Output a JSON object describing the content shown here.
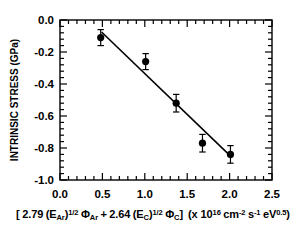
{
  "chart_data": {
    "type": "scatter",
    "title": "",
    "xlabel": "[2.79 (E_Ar)^1/2 Φ_Ar + 2.64 (E_C)^1/2 Φ_C] (x 10^16 cm^-2 s^-1 eV^0.5)",
    "ylabel": "INTRINSIC STRESS (GPa)",
    "xlim": [
      0.0,
      2.5
    ],
    "ylim": [
      -1.0,
      0.0
    ],
    "grid": false,
    "legend": "none",
    "xticks": [
      "0.0",
      "0.5",
      "1.0",
      "1.5",
      "2.0",
      "2.5"
    ],
    "xtick_values": [
      0.0,
      0.5,
      1.0,
      1.5,
      2.0,
      2.5
    ],
    "yticks": [
      "0.0",
      "-0.2",
      "-0.4",
      "-0.6",
      "-0.8",
      "-1.0"
    ],
    "ytick_values": [
      0.0,
      -0.2,
      -0.4,
      -0.6,
      -0.8,
      -1.0
    ],
    "minor_ticks_per_interval": 5,
    "marker": "filled-circle",
    "marker_color": "#000000",
    "x": [
      0.48,
      1.01,
      1.37,
      1.68,
      2.01
    ],
    "y": [
      -0.11,
      -0.26,
      -0.52,
      -0.77,
      -0.84
    ],
    "yerr": [
      0.05,
      0.05,
      0.055,
      0.055,
      0.055
    ],
    "series": [
      {
        "name": "intrinsic stress data",
        "x": [
          0.48,
          1.01,
          1.37,
          1.68,
          2.01
        ],
        "values": [
          -0.11,
          -0.26,
          -0.52,
          -0.77,
          -0.84
        ],
        "yerr": [
          0.05,
          0.05,
          0.055,
          0.055,
          0.055
        ]
      },
      {
        "name": "linear fit",
        "type": "line",
        "x": [
          0.49,
          2.03
        ],
        "values": [
          -0.075,
          -0.86
        ]
      }
    ]
  },
  "axis": {
    "y_title": "INTRINSIC STRESS (GPa)",
    "x_label_parts": {
      "open_bracket": "[",
      "coef_ar": "2.79",
      "e_ar_open": "(E",
      "e_ar_sub": "Ar",
      "e_ar_close": ")",
      "exp_half_1": "1/2",
      "phi_ar": "Φ",
      "phi_ar_sub": "Ar",
      "plus": "+",
      "coef_c": "2.64",
      "e_c_open": "(E",
      "e_c_sub": "C",
      "e_c_close": ")",
      "exp_half_2": "1/2",
      "phi_c": "Φ",
      "phi_c_sub": "C",
      "close_bracket": "]",
      "paren_open": "(x 10",
      "exp_16": "16",
      "cm": "cm",
      "exp_cm": "-2",
      "s": "s",
      "exp_s": "-1",
      "ev": "eV",
      "exp_ev": "0.5",
      "paren_close": ")"
    }
  },
  "colors": {
    "axis": "#000000",
    "marker": "#000000",
    "fit_line": "#000000",
    "background": "#ffffff"
  }
}
